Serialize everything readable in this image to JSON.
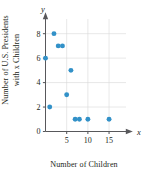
{
  "figure": {
    "title": "",
    "xlabel": "Number of Children",
    "ylabel_line1": "Number of U.S. Presidents",
    "ylabel_line2": "with x Children",
    "x_axis_variable": "x",
    "y_axis_variable": "y",
    "point_color": "#3291c8",
    "grid_color": "#d9d9d9",
    "axis_color": "#58585b",
    "background": "#ffffff"
  },
  "chart_data": {
    "type": "scatter",
    "title": "",
    "xlabel": "Number of Children",
    "ylabel": "Number of U.S. Presidents with x Children",
    "xlim": [
      0,
      19
    ],
    "ylim": [
      0,
      9.2
    ],
    "xticks": [
      5,
      10,
      15
    ],
    "xticklabels": [
      "5",
      "10",
      "15"
    ],
    "yticks": [
      0,
      2,
      4,
      6,
      8
    ],
    "yticklabels": [
      "0",
      "2",
      "4",
      "6",
      "8"
    ],
    "grid": true,
    "grid_x": [
      5,
      10,
      15
    ],
    "grid_y": [
      2,
      4,
      6,
      8
    ],
    "legend": false,
    "legend_position": "none",
    "marker": "circle",
    "marker_color": "#3291c8",
    "points": [
      {
        "x": 0,
        "y": 6
      },
      {
        "x": 1,
        "y": 2
      },
      {
        "x": 2,
        "y": 8
      },
      {
        "x": 3,
        "y": 7
      },
      {
        "x": 4,
        "y": 7
      },
      {
        "x": 5,
        "y": 3
      },
      {
        "x": 6,
        "y": 5
      },
      {
        "x": 7,
        "y": 1
      },
      {
        "x": 8,
        "y": 1
      },
      {
        "x": 10,
        "y": 1
      },
      {
        "x": 15,
        "y": 1
      }
    ],
    "x": [
      0,
      1,
      2,
      3,
      4,
      5,
      6,
      7,
      8,
      10,
      15
    ],
    "values": [
      6,
      2,
      8,
      7,
      7,
      3,
      5,
      1,
      1,
      1,
      1
    ]
  }
}
